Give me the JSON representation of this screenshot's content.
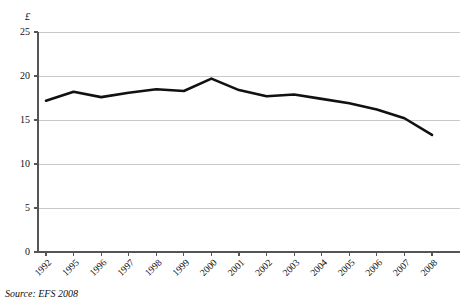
{
  "figure": {
    "title": "",
    "source_note": "Source: EFS 2008",
    "y_unit_symbol": "£"
  },
  "chart_data": {
    "type": "line",
    "title": "",
    "subtitle": "",
    "xlabel": "",
    "ylabel": "£",
    "categories": [
      "1992",
      "1995",
      "1996",
      "1997",
      "1998",
      "1999",
      "2000",
      "2001",
      "2002",
      "2003",
      "2004",
      "2005",
      "2006",
      "2007",
      "2008"
    ],
    "values": [
      17.2,
      18.2,
      17.6,
      18.1,
      18.5,
      18.3,
      19.7,
      18.4,
      17.7,
      17.9,
      17.4,
      16.9,
      16.2,
      15.2,
      13.3
    ],
    "series": [
      {
        "name": "Weekly expenditure",
        "color": "#111111",
        "values": [
          17.2,
          18.2,
          17.6,
          18.1,
          18.5,
          18.3,
          19.7,
          18.4,
          17.7,
          17.9,
          17.4,
          16.9,
          16.2,
          15.2,
          13.3
        ]
      }
    ],
    "ylim": [
      0,
      25
    ],
    "yticks": [
      0,
      5,
      10,
      15,
      20,
      25
    ],
    "ytick_labels": [
      "0",
      "5",
      "10",
      "15",
      "20",
      "25"
    ],
    "grid": true,
    "grid_axis": "y",
    "grid_color": "#c9c9c9",
    "legend": false,
    "legend_position": "none",
    "line_width": 2.6,
    "markers": false,
    "background": "#ffffff",
    "axis_color": "#555555"
  }
}
